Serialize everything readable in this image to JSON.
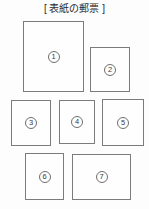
{
  "page": {
    "title": "[ 表紙の郵票 ]",
    "background_color": "#fdfdfd",
    "box_border_color": "#7b7b7b",
    "circle_border_color": "#6f6f6f",
    "text_color": "#2b2b2b"
  },
  "diagram": {
    "stamps": [
      {
        "number": "1",
        "x": 23,
        "y": 21,
        "w": 61,
        "h": 71
      },
      {
        "number": "2",
        "x": 90,
        "y": 47,
        "w": 40,
        "h": 45
      },
      {
        "number": "3",
        "x": 11,
        "y": 100,
        "w": 40,
        "h": 46
      },
      {
        "number": "4",
        "x": 59,
        "y": 100,
        "w": 36,
        "h": 44
      },
      {
        "number": "5",
        "x": 102,
        "y": 99,
        "w": 42,
        "h": 47
      },
      {
        "number": "6",
        "x": 25,
        "y": 153,
        "w": 39,
        "h": 47
      },
      {
        "number": "7",
        "x": 72,
        "y": 154,
        "w": 59,
        "h": 46
      }
    ]
  }
}
